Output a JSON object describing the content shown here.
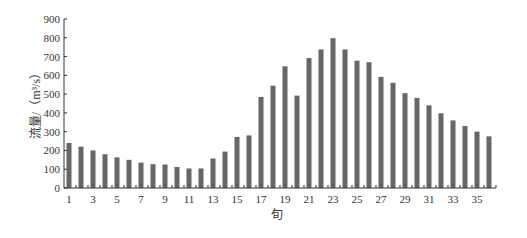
{
  "chart_data": {
    "type": "bar",
    "title": "",
    "xlabel": "旬",
    "ylabel": "流量/（m³/s）",
    "ylim": [
      0,
      900
    ],
    "yticks": [
      0,
      100,
      200,
      300,
      400,
      500,
      600,
      700,
      800,
      900
    ],
    "xtick_labels": [
      "1",
      "3",
      "5",
      "7",
      "9",
      "11",
      "13",
      "15",
      "17",
      "19",
      "21",
      "23",
      "25",
      "27",
      "29",
      "31",
      "33",
      "35"
    ],
    "grid": false,
    "legend": null,
    "bar_color": "#666666",
    "categories": [
      1,
      2,
      3,
      4,
      5,
      6,
      7,
      8,
      9,
      10,
      11,
      12,
      13,
      14,
      15,
      16,
      17,
      18,
      19,
      20,
      21,
      22,
      23,
      24,
      25,
      26,
      27,
      28,
      29,
      30,
      31,
      32,
      33,
      34,
      35,
      36
    ],
    "values": [
      240,
      220,
      200,
      180,
      163,
      150,
      135,
      127,
      125,
      112,
      104,
      104,
      157,
      194,
      272,
      280,
      485,
      545,
      648,
      492,
      692,
      738,
      798,
      738,
      678,
      670,
      592,
      560,
      505,
      480,
      440,
      398,
      360,
      330,
      300,
      275
    ]
  }
}
